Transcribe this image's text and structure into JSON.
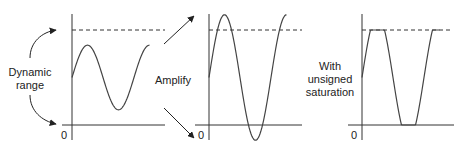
{
  "panels": [
    {
      "id": "original",
      "zero_label": "0",
      "description": "Original sine signal within dynamic range",
      "amplitude_fraction_of_range": 0.34
    },
    {
      "id": "amplified",
      "zero_label": "0",
      "description": "Amplified sine signal exceeding dynamic range",
      "amplitude_fraction_of_range": 0.66
    },
    {
      "id": "saturated",
      "zero_label": "0",
      "description": "Amplified signal clipped at 0 and max (unsigned saturation)"
    }
  ],
  "labels": {
    "dynamic_range_line1": "Dynamic",
    "dynamic_range_line2": "range",
    "amplify": "Amplify",
    "saturation_line1": "With",
    "saturation_line2": "unsigned",
    "saturation_line3": "saturation"
  },
  "colors": {
    "line": "#333333",
    "wave": "#444444",
    "text": "#222222"
  }
}
